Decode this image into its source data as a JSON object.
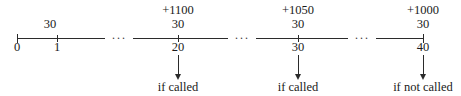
{
  "figure": {
    "type": "timeline-number-line",
    "axis": {
      "start_x": 17,
      "end_x": 423,
      "y": 38
    },
    "ticks": [
      {
        "id": "t0",
        "x": 17,
        "period": "0",
        "rate": "",
        "payment": "",
        "note": ""
      },
      {
        "id": "t1",
        "x": 57,
        "period": "1",
        "rate": "30",
        "payment": "",
        "note": ""
      },
      {
        "id": "t20",
        "x": 178,
        "period": "20",
        "rate": "30",
        "payment": "+1100",
        "note": "if called"
      },
      {
        "id": "t30",
        "x": 298,
        "period": "30",
        "rate": "30",
        "payment": "+1050",
        "note": "if called"
      },
      {
        "id": "t40",
        "x": 423,
        "period": "40",
        "rate": "30",
        "payment": "+1000",
        "note": "if not called"
      }
    ],
    "breaks": [
      {
        "id": "b1",
        "x": 117,
        "glyph": "···"
      },
      {
        "id": "b2",
        "x": 240,
        "glyph": "···"
      },
      {
        "id": "b3",
        "x": 360,
        "glyph": "···"
      }
    ],
    "colors": {
      "ink": "#2b2b2b",
      "background": "#ffffff"
    }
  }
}
